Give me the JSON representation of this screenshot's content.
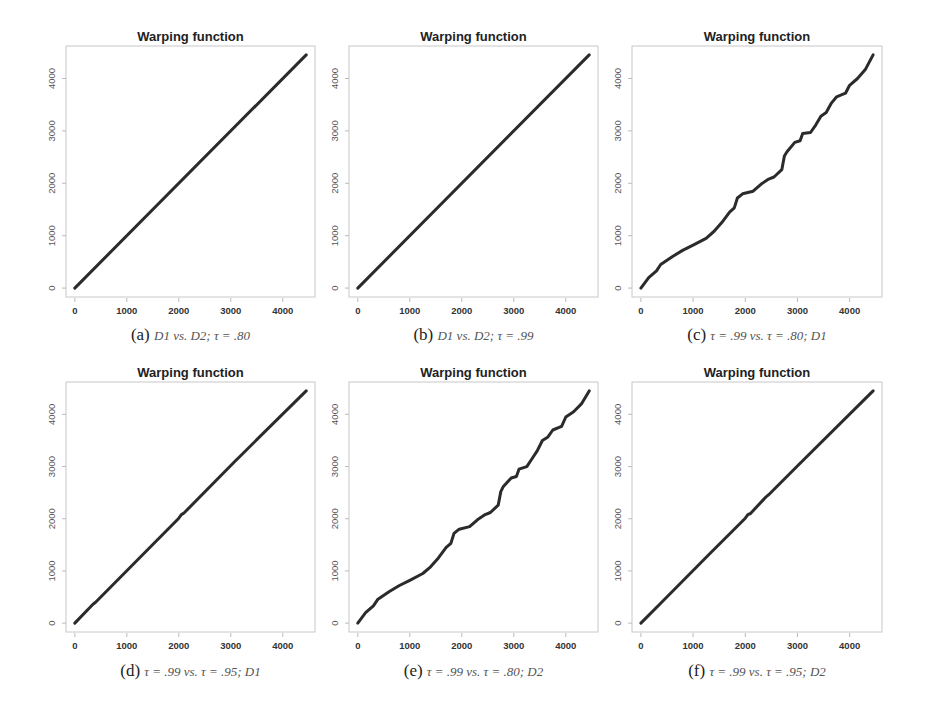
{
  "chart_data": [
    {
      "type": "line",
      "panel": "a",
      "title": "Warping function",
      "caption": {
        "tag": "(a)",
        "text": "D1 vs. D2; τ = .80"
      },
      "xlabel": "",
      "ylabel": "",
      "xlim": [
        -170,
        4620
      ],
      "ylim": [
        -170,
        4620
      ],
      "xticks": [
        0,
        1000,
        2000,
        3000,
        4000
      ],
      "yticks": [
        0,
        1000,
        2000,
        3000,
        4000
      ],
      "series": [
        {
          "name": "warping",
          "x": [
            0,
            4450
          ],
          "y": [
            0,
            4450
          ]
        }
      ]
    },
    {
      "type": "line",
      "panel": "b",
      "title": "Warping function",
      "caption": {
        "tag": "(b)",
        "text": "D1 vs. D2; τ = .99"
      },
      "xlabel": "",
      "ylabel": "",
      "xlim": [
        -170,
        4620
      ],
      "ylim": [
        -170,
        4620
      ],
      "xticks": [
        0,
        1000,
        2000,
        3000,
        4000
      ],
      "yticks": [
        0,
        1000,
        2000,
        3000,
        4000
      ],
      "series": [
        {
          "name": "warping",
          "x": [
            0,
            4450
          ],
          "y": [
            0,
            4450
          ]
        }
      ]
    },
    {
      "type": "line",
      "panel": "c",
      "title": "Warping function",
      "caption": {
        "tag": "(c)",
        "text": "τ = .99 vs. τ = .80; D1"
      },
      "xlabel": "",
      "ylabel": "",
      "xlim": [
        -170,
        4620
      ],
      "ylim": [
        -170,
        4620
      ],
      "xticks": [
        0,
        1000,
        2000,
        3000,
        4000
      ],
      "yticks": [
        0,
        1000,
        2000,
        3000,
        4000
      ],
      "series": [
        {
          "name": "warping",
          "x": [
            0,
            150,
            300,
            380,
            600,
            800,
            1000,
            1250,
            1400,
            1550,
            1700,
            1790,
            1850,
            1950,
            2150,
            2300,
            2450,
            2550,
            2700,
            2750,
            2800,
            2950,
            3050,
            3100,
            3250,
            3350,
            3450,
            3550,
            3650,
            3750,
            3920,
            4000,
            4150,
            4300,
            4450
          ],
          "y": [
            0,
            200,
            330,
            450,
            600,
            720,
            820,
            950,
            1080,
            1250,
            1450,
            1530,
            1720,
            1800,
            1850,
            1980,
            2080,
            2120,
            2260,
            2520,
            2600,
            2780,
            2810,
            2950,
            2970,
            3110,
            3280,
            3350,
            3530,
            3650,
            3720,
            3870,
            4000,
            4170,
            4450
          ]
        }
      ]
    },
    {
      "type": "line",
      "panel": "d",
      "title": "Warping function",
      "caption": {
        "tag": "(d)",
        "text": "τ = .99 vs. τ = .95; D1"
      },
      "xlabel": "",
      "ylabel": "",
      "xlim": [
        -170,
        4620
      ],
      "ylim": [
        -170,
        4620
      ],
      "xticks": [
        0,
        1000,
        2000,
        3000,
        4000
      ],
      "yticks": [
        0,
        1000,
        2000,
        3000,
        4000
      ],
      "series": [
        {
          "name": "warping",
          "x": [
            0,
            350,
            400,
            2000,
            2050,
            2100,
            3100,
            3150,
            4450
          ],
          "y": [
            0,
            360,
            400,
            2010,
            2080,
            2110,
            3120,
            3170,
            4450
          ]
        }
      ]
    },
    {
      "type": "line",
      "panel": "e",
      "title": "Warping function",
      "caption": {
        "tag": "(e)",
        "text": "τ = .99 vs. τ = .80; D2"
      },
      "xlabel": "",
      "ylabel": "",
      "xlim": [
        -170,
        4620
      ],
      "ylim": [
        -170,
        4620
      ],
      "xticks": [
        0,
        1000,
        2000,
        3000,
        4000
      ],
      "yticks": [
        0,
        1000,
        2000,
        3000,
        4000
      ],
      "series": [
        {
          "name": "warping",
          "x": [
            0,
            150,
            300,
            380,
            600,
            800,
            1000,
            1250,
            1400,
            1550,
            1700,
            1790,
            1850,
            1950,
            2150,
            2300,
            2450,
            2550,
            2700,
            2750,
            2800,
            2950,
            3050,
            3100,
            3250,
            3350,
            3450,
            3550,
            3650,
            3750,
            3920,
            4000,
            4150,
            4300,
            4450
          ],
          "y": [
            0,
            200,
            330,
            450,
            600,
            720,
            820,
            950,
            1080,
            1250,
            1450,
            1530,
            1720,
            1800,
            1850,
            1980,
            2080,
            2120,
            2260,
            2520,
            2620,
            2780,
            2810,
            2950,
            3000,
            3150,
            3300,
            3500,
            3560,
            3700,
            3770,
            3950,
            4050,
            4200,
            4450
          ]
        }
      ]
    },
    {
      "type": "line",
      "panel": "f",
      "title": "Warping function",
      "caption": {
        "tag": "(f)",
        "text": "τ = .99 vs. τ = .95; D2"
      },
      "xlabel": "",
      "ylabel": "",
      "xlim": [
        -170,
        4620
      ],
      "ylim": [
        -170,
        4620
      ],
      "xticks": [
        0,
        1000,
        2000,
        3000,
        4000
      ],
      "yticks": [
        0,
        1000,
        2000,
        3000,
        4000
      ],
      "series": [
        {
          "name": "warping",
          "x": [
            0,
            400,
            1300,
            2000,
            2050,
            2100,
            2400,
            2450,
            3000,
            4450
          ],
          "y": [
            0,
            400,
            1310,
            2010,
            2080,
            2100,
            2420,
            2460,
            3010,
            4450
          ]
        }
      ]
    }
  ]
}
